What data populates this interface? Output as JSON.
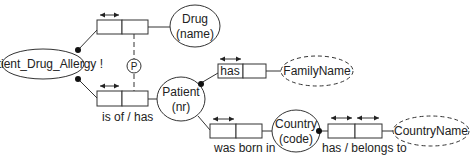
{
  "diagram": {
    "type": "ORM fact-type diagram",
    "entities": {
      "patient_drug_allergy": "Patient_Drug_Allergy !",
      "drug_line1": "Drug",
      "drug_line2": "(name)",
      "patient_line1": "Patient",
      "patient_line2": "(nr)",
      "country_line1": "Country",
      "country_line2": "(code)"
    },
    "value_types": {
      "family_name": "FamilyName",
      "country_name": "CountryName"
    },
    "fact_types": {
      "patient_has_familyname": "has",
      "allergy_patient": "is of / has",
      "patient_born_in": "was born in",
      "country_has_name": "has / belongs to"
    },
    "constraints": {
      "pair_subset": "P"
    }
  }
}
